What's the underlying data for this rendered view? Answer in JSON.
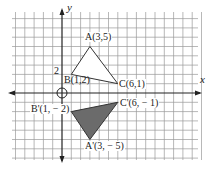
{
  "diagram": {
    "axes": {
      "x_label": "x",
      "y_label": "y",
      "tick_label": "2"
    },
    "grid": {
      "origin_px": [
        62,
        93
      ],
      "unit_px": 9.3,
      "x_range": [
        -6,
        15
      ],
      "y_range": [
        -7,
        9
      ],
      "line_color": "#9a9a9a",
      "axis_color": "#222222"
    },
    "original_triangle": {
      "name": "ABC",
      "fill": "#ffffff",
      "stroke": "#333333",
      "vertices": [
        {
          "name": "A",
          "label": "A(3,5)",
          "x": 3,
          "y": 5
        },
        {
          "name": "B",
          "label": "B(1,2)",
          "x": 1,
          "y": 2
        },
        {
          "name": "C",
          "label": "C(6,1)",
          "x": 6,
          "y": 1
        }
      ]
    },
    "image_triangle": {
      "name": "A'B'C'",
      "fill": "#6b6b6b",
      "stroke": "#333333",
      "vertices": [
        {
          "name": "A'",
          "label": "A'(3, − 5)",
          "x": 3,
          "y": -5
        },
        {
          "name": "B'",
          "label": "B'(1, − 2)",
          "x": 1,
          "y": -2
        },
        {
          "name": "C'",
          "label": "C'(6, − 1)",
          "x": 6,
          "y": -1
        }
      ]
    },
    "origin_marker": "circle"
  }
}
